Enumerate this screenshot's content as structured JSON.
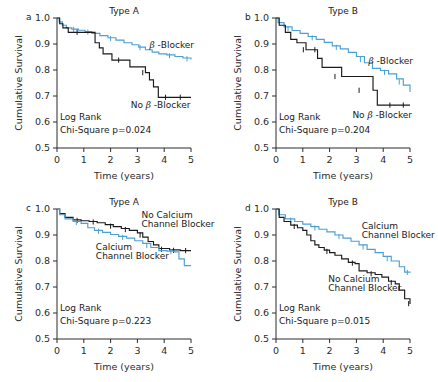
{
  "figure": {
    "axis": {
      "xlabel": "Time  (years)",
      "ylabel": "Cumulative Survival",
      "xticks": [
        "0",
        "1",
        "2",
        "3",
        "4",
        "5"
      ],
      "yticks": [
        "0.5",
        "0.6",
        "0.7",
        "0.8",
        "0.9",
        "1.0"
      ],
      "xlim": [
        0,
        5
      ],
      "ylim": [
        0.5,
        1.0
      ]
    },
    "colors": {
      "blue": "#4d9fd4",
      "black": "#1a1a1a",
      "text": "#1a1a1a"
    }
  },
  "chart_data": [
    {
      "id": "panel-a",
      "type": "line",
      "letter": "a",
      "title": "Type A",
      "xlabel": "Time  (years)",
      "ylabel": "Cumulative Survival",
      "xlim": [
        0,
        5
      ],
      "ylim": [
        0.5,
        1.0
      ],
      "xticks": [
        0,
        1,
        2,
        3,
        4,
        5
      ],
      "yticks": [
        0.5,
        0.6,
        0.7,
        0.8,
        0.9,
        1.0
      ],
      "grid": false,
      "stat_line1": "Log Rank",
      "stat_line2": "Chi-Square p=0.024",
      "p_value": 0.024,
      "annotations": [
        {
          "text": "β -Blocker",
          "italic_lead": true,
          "x": 3.45,
          "y": 0.885
        },
        {
          "text": "No β -Blocker",
          "italic_lead": true,
          "x": 2.75,
          "y": 0.655
        }
      ],
      "series": [
        {
          "name": "β -Blocker",
          "color": "#4d9fd4",
          "step": true,
          "x": [
            0,
            0.08,
            0.2,
            0.35,
            0.55,
            0.8,
            1.05,
            1.3,
            1.6,
            1.9,
            2.2,
            2.5,
            2.8,
            3.05,
            3.3,
            3.55,
            3.8,
            4.1,
            4.4,
            4.7,
            5.0
          ],
          "y": [
            1.0,
            0.985,
            0.972,
            0.962,
            0.957,
            0.953,
            0.948,
            0.941,
            0.932,
            0.924,
            0.915,
            0.905,
            0.897,
            0.888,
            0.878,
            0.869,
            0.862,
            0.858,
            0.852,
            0.846,
            0.84
          ],
          "censor_x": [
            0.62,
            1.15,
            2.0,
            3.1,
            4.2,
            4.85
          ],
          "censor_y": [
            0.956,
            0.946,
            0.921,
            0.886,
            0.855,
            0.843
          ]
        },
        {
          "name": "No β -Blocker",
          "color": "#1a1a1a",
          "step": true,
          "x": [
            0,
            0.1,
            0.22,
            0.42,
            1.25,
            1.42,
            1.58,
            1.72,
            2.05,
            2.6,
            2.72,
            3.05,
            3.3,
            3.45,
            3.6,
            3.78,
            5.0
          ],
          "y": [
            1.0,
            0.978,
            0.962,
            0.945,
            0.945,
            0.905,
            0.885,
            0.862,
            0.838,
            0.838,
            0.812,
            0.812,
            0.79,
            0.762,
            0.735,
            0.695,
            0.695
          ],
          "censor_x": [
            0.75,
            2.3,
            3.2,
            4.05,
            4.6
          ],
          "censor_y": [
            0.945,
            0.838,
            0.79,
            0.695,
            0.695
          ]
        }
      ]
    },
    {
      "id": "panel-b",
      "type": "line",
      "letter": "b",
      "title": "Type B",
      "xlabel": "Time  (years)",
      "ylabel": "Cumulative Survival",
      "xlim": [
        0,
        5
      ],
      "ylim": [
        0.5,
        1.0
      ],
      "xticks": [
        0,
        1,
        2,
        3,
        4,
        5
      ],
      "yticks": [
        0.5,
        0.6,
        0.7,
        0.8,
        0.9,
        1.0
      ],
      "grid": false,
      "stat_line1": "Log Rank",
      "stat_line2": "Chi-Square p=0.204",
      "p_value": 0.204,
      "annotations": [
        {
          "text": "β -Blocker",
          "italic_lead": true,
          "x": 3.45,
          "y": 0.825
        },
        {
          "text": "No β -Blocker",
          "italic_lead": true,
          "x": 2.85,
          "y": 0.615
        }
      ],
      "series": [
        {
          "name": "β -Blocker",
          "color": "#4d9fd4",
          "step": true,
          "x": [
            0,
            0.08,
            0.3,
            0.6,
            0.9,
            1.2,
            1.5,
            1.8,
            2.1,
            2.4,
            2.7,
            3.0,
            3.3,
            3.6,
            3.9,
            4.2,
            4.5,
            4.75,
            5.0
          ],
          "y": [
            1.0,
            0.982,
            0.966,
            0.952,
            0.941,
            0.929,
            0.918,
            0.906,
            0.893,
            0.881,
            0.868,
            0.852,
            0.828,
            0.806,
            0.798,
            0.785,
            0.766,
            0.742,
            0.715
          ],
          "censor_x": [
            0.45,
            1.35,
            2.25,
            3.15,
            4.05,
            4.6
          ],
          "censor_y": [
            0.959,
            0.924,
            0.887,
            0.84,
            0.791,
            0.754
          ]
        },
        {
          "name": "No β -Blocker",
          "color": "#1a1a1a",
          "step": true,
          "x": [
            0,
            0.12,
            0.35,
            0.55,
            0.78,
            1.12,
            1.35,
            1.55,
            1.72,
            2.45,
            2.6,
            3.62,
            3.78,
            5.0
          ],
          "y": [
            1.0,
            0.972,
            0.945,
            0.918,
            0.905,
            0.878,
            0.878,
            0.845,
            0.81,
            0.775,
            0.775,
            0.722,
            0.665,
            0.665
          ],
          "censor_x": [
            1.02,
            1.45,
            2.2,
            3.1,
            4.25,
            4.75
          ],
          "censor_y": [
            0.878,
            0.878,
            0.775,
            0.722,
            0.665,
            0.665
          ]
        }
      ]
    },
    {
      "id": "panel-c",
      "type": "line",
      "letter": "c",
      "title": "Type A",
      "xlabel": "Time  (years)",
      "ylabel": "Cumulative Survival",
      "xlim": [
        0,
        5
      ],
      "ylim": [
        0.5,
        1.0
      ],
      "xticks": [
        0,
        1,
        2,
        3,
        4,
        5
      ],
      "yticks": [
        0.5,
        0.6,
        0.7,
        0.8,
        0.9,
        1.0
      ],
      "grid": false,
      "stat_line1": "Log Rank",
      "stat_line2": "Chi-Square p=0.223",
      "p_value": 0.223,
      "annotations": [
        {
          "text": "No Calcium",
          "x": 3.15,
          "y": 0.967
        },
        {
          "text": "Channel Blocker",
          "x": 3.15,
          "y": 0.932
        },
        {
          "text": "Calcium",
          "x": 1.45,
          "y": 0.843
        },
        {
          "text": "Channel Blocker",
          "x": 1.45,
          "y": 0.808
        }
      ],
      "series": [
        {
          "name": "No Calcium Channel Blocker",
          "color": "#1a1a1a",
          "step": true,
          "x": [
            0,
            0.1,
            0.3,
            0.6,
            0.9,
            1.2,
            1.5,
            1.8,
            2.1,
            2.4,
            2.7,
            3.0,
            3.2,
            3.4,
            3.6,
            3.8,
            4.2,
            4.6,
            5.0
          ],
          "y": [
            1.0,
            0.982,
            0.968,
            0.958,
            0.955,
            0.952,
            0.947,
            0.94,
            0.932,
            0.925,
            0.918,
            0.908,
            0.892,
            0.875,
            0.862,
            0.848,
            0.843,
            0.84,
            0.84
          ],
          "censor_x": [
            0.75,
            1.35,
            2.0,
            2.55,
            3.1,
            3.9,
            4.35,
            4.8
          ],
          "censor_y": [
            0.956,
            0.95,
            0.934,
            0.921,
            0.9,
            0.845,
            0.841,
            0.84
          ]
        },
        {
          "name": "Calcium Channel Blocker",
          "color": "#4d9fd4",
          "step": true,
          "x": [
            0,
            0.1,
            0.3,
            0.6,
            0.9,
            1.15,
            1.4,
            1.7,
            2.0,
            2.3,
            2.6,
            2.9,
            3.2,
            3.5,
            3.8,
            4.1,
            4.4,
            4.55,
            4.75,
            5.0
          ],
          "y": [
            1.0,
            0.978,
            0.962,
            0.952,
            0.945,
            0.928,
            0.918,
            0.91,
            0.902,
            0.895,
            0.888,
            0.878,
            0.868,
            0.852,
            0.84,
            0.838,
            0.835,
            0.808,
            0.782,
            0.782
          ],
          "censor_x": [
            0.72,
            1.55,
            2.45,
            3.35,
            4.25
          ],
          "censor_y": [
            0.948,
            0.914,
            0.891,
            0.86,
            0.836
          ]
        }
      ]
    },
    {
      "id": "panel-d",
      "type": "line",
      "letter": "d",
      "title": "Type B",
      "xlabel": "Time  (years)",
      "ylabel": "Cumulative Survival",
      "xlim": [
        0,
        5
      ],
      "ylim": [
        0.5,
        1.0
      ],
      "xticks": [
        0,
        1,
        2,
        3,
        4,
        5
      ],
      "yticks": [
        0.5,
        0.6,
        0.7,
        0.8,
        0.9,
        1.0
      ],
      "grid": false,
      "stat_line1": "Log Rank",
      "stat_line2": "Chi-Square p=0.015",
      "p_value": 0.015,
      "annotations": [
        {
          "text": "Calcium",
          "x": 3.2,
          "y": 0.925
        },
        {
          "text": "Channel Blocker",
          "x": 3.2,
          "y": 0.89
        },
        {
          "text": "No Calcium",
          "x": 1.95,
          "y": 0.718
        },
        {
          "text": "Channel Blocker",
          "x": 1.95,
          "y": 0.683
        }
      ],
      "series": [
        {
          "name": "Calcium Channel Blocker",
          "color": "#4d9fd4",
          "step": true,
          "x": [
            0,
            0.1,
            0.35,
            0.7,
            1.0,
            1.3,
            1.6,
            1.9,
            2.2,
            2.5,
            2.8,
            3.1,
            3.4,
            3.7,
            4.0,
            4.3,
            4.6,
            4.8,
            5.0
          ],
          "y": [
            1.0,
            0.978,
            0.962,
            0.952,
            0.942,
            0.932,
            0.922,
            0.912,
            0.9,
            0.888,
            0.876,
            0.862,
            0.845,
            0.832,
            0.818,
            0.8,
            0.778,
            0.757,
            0.755
          ],
          "censor_x": [
            0.55,
            1.45,
            2.35,
            3.25,
            4.15,
            4.9
          ],
          "censor_y": [
            0.957,
            0.927,
            0.894,
            0.854,
            0.809,
            0.756
          ]
        },
        {
          "name": "No Calcium Channel Blocker",
          "color": "#1a1a1a",
          "step": true,
          "x": [
            0,
            0.12,
            0.3,
            0.55,
            0.8,
            1.0,
            1.15,
            1.3,
            1.45,
            1.6,
            1.8,
            2.0,
            2.2,
            2.45,
            2.7,
            2.95,
            3.1,
            3.4,
            3.7,
            3.95,
            4.2,
            4.45,
            4.6,
            4.8,
            5.0
          ],
          "y": [
            1.0,
            0.968,
            0.952,
            0.938,
            0.928,
            0.918,
            0.9,
            0.878,
            0.862,
            0.852,
            0.842,
            0.832,
            0.822,
            0.808,
            0.795,
            0.79,
            0.762,
            0.755,
            0.748,
            0.738,
            0.722,
            0.712,
            0.688,
            0.655,
            0.635
          ],
          "censor_x": [
            0.68,
            1.9,
            2.85,
            3.55,
            4.3,
            4.95
          ],
          "censor_y": [
            0.933,
            0.837,
            0.792,
            0.751,
            0.717,
            0.636
          ]
        }
      ]
    }
  ]
}
